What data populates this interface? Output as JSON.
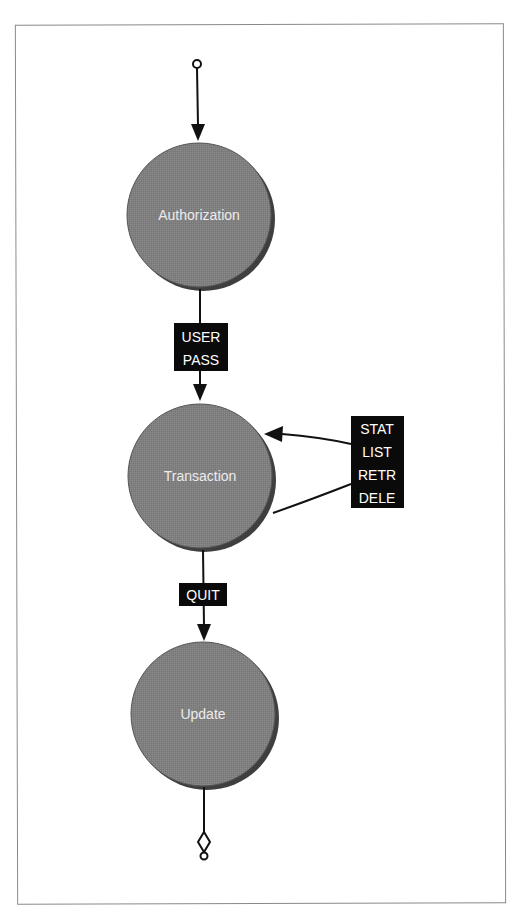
{
  "diagram": {
    "type": "state-machine",
    "colors": {
      "state_fill": "#7f7f7f",
      "state_shadow": "#3f3f3f",
      "state_text": "#ececec",
      "edge_stroke": "#111111",
      "label_bg": "#0a0a0a",
      "label_text": "#ffffff",
      "frame_border": "#8a8a8a"
    },
    "start": {
      "marker": "open-circle"
    },
    "end": {
      "marker": "diamond-with-circle"
    },
    "states": [
      {
        "id": "authorization",
        "label": "Authorization"
      },
      {
        "id": "transaction",
        "label": "Transaction"
      },
      {
        "id": "update",
        "label": "Update"
      }
    ],
    "transitions": [
      {
        "from": "start",
        "to": "authorization",
        "labels": []
      },
      {
        "from": "authorization",
        "to": "transaction",
        "labels": [
          "USER",
          "PASS"
        ]
      },
      {
        "from": "transaction",
        "to": "transaction",
        "labels": [
          "STAT",
          "LIST",
          "RETR",
          "DELE"
        ]
      },
      {
        "from": "transaction",
        "to": "update",
        "labels": [
          "QUIT"
        ]
      },
      {
        "from": "update",
        "to": "end",
        "labels": []
      }
    ]
  }
}
